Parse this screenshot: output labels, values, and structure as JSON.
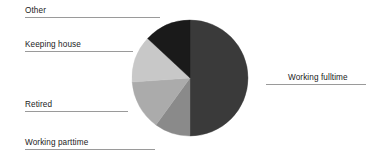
{
  "chart_data": {
    "type": "pie",
    "title": "",
    "subtitle": "",
    "xlabel": "",
    "ylabel": "",
    "grid": false,
    "legend_position": "none",
    "label_style": "outside-with-leader-lines",
    "start_angle_deg": 0,
    "direction": "clockwise",
    "categories": [
      "Working fulltime",
      "Working parttime",
      "Retired",
      "Keeping house",
      "Other"
    ],
    "values": [
      50,
      10,
      14,
      13,
      13
    ],
    "units": "percent",
    "colors": [
      "#3a3a3a",
      "#8a8a8a",
      "#ababab",
      "#c8c8c8",
      "#1a1a1a"
    ],
    "slices": [
      {
        "label": "Working fulltime",
        "value": 50,
        "color": "#3a3a3a",
        "start_deg": 0,
        "end_deg": 180
      },
      {
        "label": "Working parttime",
        "value": 10,
        "color": "#8a8a8a",
        "start_deg": 180,
        "end_deg": 216
      },
      {
        "label": "Retired",
        "value": 14,
        "color": "#ababab",
        "start_deg": 216,
        "end_deg": 266
      },
      {
        "label": "Keeping house",
        "value": 13,
        "color": "#c8c8c8",
        "start_deg": 266,
        "end_deg": 313
      },
      {
        "label": "Other",
        "value": 13,
        "color": "#1a1a1a",
        "start_deg": 313,
        "end_deg": 360
      }
    ],
    "geometry": {
      "center_x": 190,
      "center_y": 78,
      "radius": 58
    }
  },
  "labels": {
    "other": "Other",
    "keeping_house": "Keeping house",
    "retired": "Retired",
    "working_parttime": "Working parttime",
    "working_fulltime": "Working fulltime"
  },
  "colors": {
    "background": "#ffffff",
    "leader_line": "#9a9a9a",
    "text": "#1b1b1b"
  }
}
